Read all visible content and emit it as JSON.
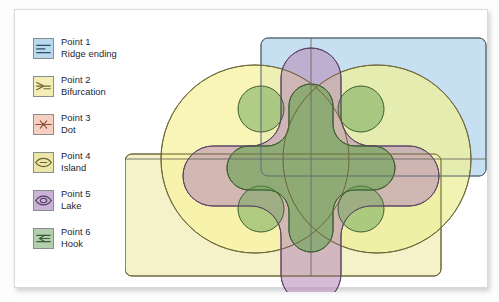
{
  "figure": {
    "background_color": "#ffffff"
  },
  "legend": {
    "items": [
      {
        "id": "point-1",
        "label_line1": "Point 1",
        "label_line2": "Ridge ending",
        "icon": "ridge-ending-icon",
        "swatch_color": "#b9d9ee",
        "stroke_color": "#2f4a63"
      },
      {
        "id": "point-2",
        "label_line1": "Point 2",
        "label_line2": "Bifurcation",
        "icon": "bifurcation-icon",
        "swatch_color": "#f4eeb6",
        "stroke_color": "#6d6431"
      },
      {
        "id": "point-3",
        "label_line1": "Point 3",
        "label_line2": "Dot",
        "icon": "dot-icon",
        "swatch_color": "#f6cfc0",
        "stroke_color": "#8b4a36"
      },
      {
        "id": "point-4",
        "label_line1": "Point 4",
        "label_line2": "Island",
        "icon": "island-icon",
        "swatch_color": "#ece7a8",
        "stroke_color": "#6d6431"
      },
      {
        "id": "point-5",
        "label_line1": "Point 5",
        "label_line2": "Lake",
        "icon": "lake-icon",
        "swatch_color": "#cbb3d8",
        "stroke_color": "#4f3a63"
      },
      {
        "id": "point-6",
        "label_line1": "Point 6",
        "label_line2": "Hook",
        "icon": "hook-icon",
        "swatch_color": "#b4cfae",
        "stroke_color": "#3a5c39"
      }
    ]
  },
  "diagram": {
    "shapes": [
      {
        "name": "ridge-ending-region",
        "type": "rounded-rectangle",
        "legend_ref": "Point 1",
        "fill": "#bfdcef",
        "opacity": 0.85,
        "stroke": "#5a6b77"
      },
      {
        "name": "bifurcation-region",
        "type": "rounded-rectangle",
        "legend_ref": "Point 2",
        "fill": "#f2efbe",
        "opacity": 0.85,
        "stroke": "#6f6a3c"
      },
      {
        "name": "dot-region-left",
        "type": "circle",
        "legend_ref": "Point 3",
        "fill": "#f7f2a8",
        "opacity": 0.8,
        "stroke": "#6f6a3c"
      },
      {
        "name": "island-region-right",
        "type": "circle",
        "legend_ref": "Point 4",
        "fill": "#eef0a0",
        "opacity": 0.8,
        "stroke": "#6f6a3c"
      },
      {
        "name": "lake-region",
        "type": "four-lobed-cross",
        "legend_ref": "Point 5",
        "fill": "#c49bc0",
        "opacity": 0.62,
        "stroke": "#5d4666"
      },
      {
        "name": "hook-region",
        "type": "four-lobed-cross",
        "legend_ref": "Point 6",
        "fill": "#7fae63",
        "opacity": 0.55,
        "stroke": "#3c5c32"
      },
      {
        "name": "hook-region-diagonals",
        "type": "small-circles",
        "legend_ref": "Point 6",
        "fill": "#7fae63",
        "opacity": 0.55,
        "stroke": "#3c5c32"
      }
    ],
    "axes": {
      "vertical_divider_x": 290,
      "horizontal_divider_y": 152,
      "stroke": "#6a6a62"
    }
  }
}
